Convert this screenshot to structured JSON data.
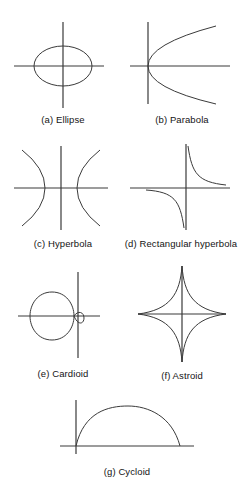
{
  "figure": {
    "background_color": "#ffffff",
    "stroke_color": "#333333",
    "axis_color": "#3a3a3a",
    "caption_color": "#141414",
    "panels": [
      {
        "key": "ellipse",
        "label": "(a) Ellipse",
        "curve_type": "ellipse",
        "axes": {
          "x_axis": true,
          "y_axis": true
        },
        "geometry": {
          "center_x": 55,
          "center_y": 50,
          "radius_x": 29,
          "radius_y": 20
        }
      },
      {
        "key": "parabola",
        "label": "(b) Parabola",
        "curve_type": "parabola",
        "axes": {
          "x_axis": true,
          "y_axis": true
        },
        "geometry": {
          "vertex_x": 22,
          "vertex_y": 50,
          "opens": "right",
          "half_height": 42,
          "extent": 68
        }
      },
      {
        "key": "hyperbola",
        "label": "(c) Hyperbola",
        "curve_type": "hyperbola",
        "axes": {
          "x_axis": true,
          "y_axis": true
        },
        "geometry": {
          "center_x": 55,
          "center_y": 48,
          "vertex_offset": 16,
          "half_height": 40,
          "extent": 44
        }
      },
      {
        "key": "rectangular-hyperbola",
        "label": "(d) Rectangular hyperbola",
        "curve_type": "rectangular-hyperbola",
        "axes": {
          "x_axis": true,
          "y_axis": true
        },
        "geometry": {
          "center_x": 58,
          "center_y": 48,
          "quadrants": [
            1,
            3
          ]
        }
      },
      {
        "key": "cardioid",
        "label": "(e) Cardioid",
        "curve_type": "cardioid",
        "axes": {
          "x_axis": true,
          "y_axis": true
        },
        "geometry": {
          "cusp_x": 62,
          "cusp_y": 50,
          "opens": "left",
          "width": 46,
          "height": 46
        }
      },
      {
        "key": "astroid",
        "label": "(f) Astroid",
        "curve_type": "astroid",
        "axes": {
          "x_axis": true,
          "y_axis": true
        },
        "geometry": {
          "center_x": 54,
          "center_y": 52,
          "radius_x": 40,
          "radius_y": 48,
          "cusps": 4
        }
      },
      {
        "key": "cycloid",
        "label": "(g) Cycloid",
        "curve_type": "cycloid",
        "axes": {
          "x_axis": true,
          "y_axis": true
        },
        "geometry": {
          "origin_x": 24,
          "baseline_y": 54,
          "arch_width": 104,
          "arch_height": 38,
          "arches": 1
        }
      }
    ]
  }
}
